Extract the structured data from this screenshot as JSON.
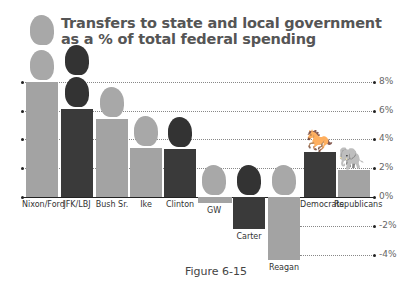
{
  "chart_data": {
    "type": "bar",
    "title": "Transfers to state and local government as a % of total federal spending",
    "xlabel": "",
    "ylabel": "",
    "categories": [
      "Nixon/Ford",
      "JFK/LBJ",
      "Bush Sr.",
      "Ike",
      "Clinton",
      "GW",
      "Carter",
      "Reagan",
      "Democrats",
      "Republicans"
    ],
    "values": [
      8.0,
      6.1,
      5.4,
      3.4,
      3.3,
      -0.4,
      -2.2,
      -4.4,
      3.1,
      1.9
    ],
    "party": [
      "R",
      "D",
      "R",
      "R",
      "D",
      "R",
      "D",
      "R",
      "D",
      "R"
    ],
    "yticks": [
      "8%",
      "6%",
      "4%",
      "2%",
      "0%",
      "-2%",
      "-4%"
    ],
    "ylim": [
      -4.5,
      8.5
    ],
    "grid": true,
    "legend": "none",
    "caption": "Figure 6-15"
  },
  "title_line1": "Transfers to state and local government",
  "title_line2": "as a % of total federal spending",
  "colors": {
    "republican": "#a3a3a3",
    "democrat": "#3a3a3a"
  },
  "caption": "Figure 6-15",
  "icons": [
    "president-head-silhouette",
    "donkey-icon",
    "elephant-icon"
  ]
}
